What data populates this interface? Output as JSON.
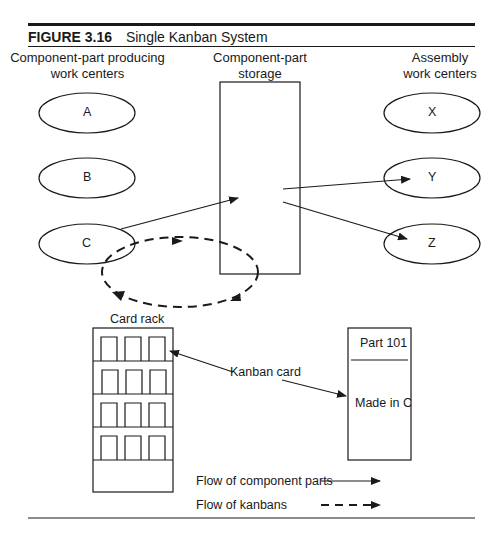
{
  "figure": {
    "number": "FIGURE 3.16",
    "title": "Single Kanban System"
  },
  "headers": {
    "producing": [
      "Component-part producing",
      "work centers"
    ],
    "storage": [
      "Component-part",
      "storage"
    ],
    "assembly": [
      "Assembly",
      "work centers"
    ]
  },
  "work_centers": {
    "producing": [
      "A",
      "B",
      "C"
    ],
    "assembly": [
      "X",
      "Y",
      "Z"
    ]
  },
  "card_rack": {
    "label": "Card rack",
    "rows": 4,
    "slots_per_row": 3
  },
  "kanban_card": {
    "pointer_label": "Kanban card",
    "part": "Part 101",
    "origin": "Made in C"
  },
  "legend": {
    "solid": "Flow of component parts",
    "dashed": "Flow of kanbans"
  },
  "colors": {
    "ink": "#1a1a1a",
    "background": "#ffffff"
  }
}
